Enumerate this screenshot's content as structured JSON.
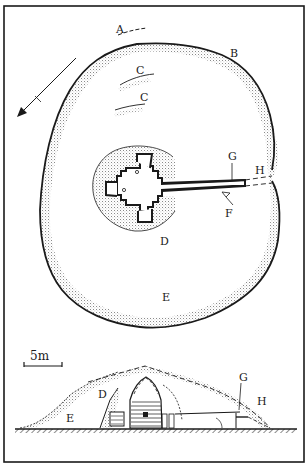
{
  "figure": {
    "labels": {
      "A": "A",
      "B": "B",
      "C1": "C",
      "C2": "C",
      "D_plan": "D",
      "E_plan": "E",
      "F": "F",
      "G_plan": "G",
      "H_plan": "H",
      "D_section": "D",
      "E_section": "E",
      "G_section": "G",
      "H_section": "H"
    },
    "scale_bar": {
      "label": "5m"
    },
    "north_arrow": {
      "icon": "north-arrow-icon"
    },
    "colors": {
      "ink": "#1a1a1a",
      "stipple": "#9a9a9a",
      "paper": "#ffffff"
    }
  }
}
